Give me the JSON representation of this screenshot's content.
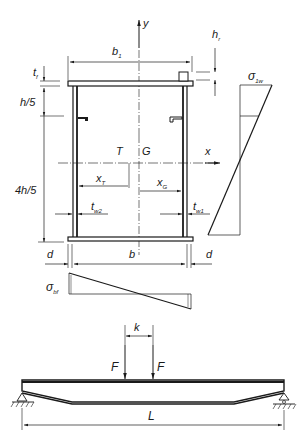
{
  "diagram": {
    "type": "engineering cross-section and beam loading",
    "colors": {
      "ink": "#1a1a1a",
      "background": "#ffffff"
    },
    "cross_section": {
      "labels": {
        "y_axis": "y",
        "x_axis": "x",
        "flange_width": "b",
        "flange_width_sub": "1",
        "rail_height": "h",
        "rail_height_sub": "r",
        "flange_thickness": "t",
        "flange_thickness_sub": "f",
        "upper_fifth": "h/5",
        "lower_part": "4h/5",
        "shear_center": "T",
        "centroid": "G",
        "shear_center_dist": "x",
        "shear_center_dist_sub": "T",
        "centroid_dist": "x",
        "centroid_dist_sub": "G",
        "web2_thickness": "t",
        "web2_thickness_sub": "w2",
        "web1_thickness": "t",
        "web1_thickness_sub": "w1",
        "web_spacing": "b",
        "overhang_left": "d",
        "overhang_right": "d"
      }
    },
    "stress_diagrams": {
      "web_stress": {
        "symbol": "σ",
        "sub": "1w"
      },
      "flange_stress": {
        "symbol": "σ",
        "sub": "bf"
      }
    },
    "beam": {
      "load_left": "F",
      "load_right": "F",
      "load_spacing": "k",
      "span": "L"
    }
  }
}
